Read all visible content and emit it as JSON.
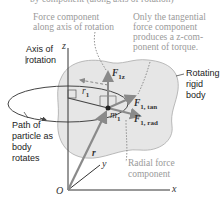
{
  "cutoff_text": "by component (along axis of rotation)",
  "labels": {
    "axial_force": [
      "Force component",
      "along axis of rotation"
    ],
    "tangential_note": [
      "Only the tangential",
      "force component",
      "produces a z-com-",
      "ponent of torque."
    ],
    "axis_of_rotation": [
      "Axis of",
      "rotation"
    ],
    "path": [
      "Path of",
      "particle as",
      "body",
      "rotates"
    ],
    "rotating_body": [
      "Rotating",
      "rigid",
      "body"
    ],
    "radial_force": [
      "Radial force",
      "component"
    ]
  },
  "vectors": {
    "F1z": {
      "main": "F",
      "sub": "1z"
    },
    "F1tan": {
      "main": "F",
      "sub": "1, tan"
    },
    "F1rad": {
      "main": "F",
      "sub": "1, rad"
    },
    "r1": {
      "main": "r",
      "sub": "1"
    },
    "m1": {
      "main": "m",
      "sub": "1"
    },
    "r": "r"
  },
  "axes": {
    "z": "z",
    "y": "y",
    "x": "x",
    "origin": "O"
  },
  "colors": {
    "body_fill": "#e6e6e6",
    "body_stroke": "#9a9a9a",
    "vector": "#8a8a8a",
    "line": "#333333",
    "gray_text": "#9a9a9a"
  }
}
